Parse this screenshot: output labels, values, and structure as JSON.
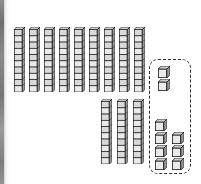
{
  "image": {
    "title": "Base-ten blocks place value model",
    "width": 201,
    "height": 184,
    "background_color": "#ffffff"
  },
  "legend": {
    "rod_name": "ten-rod",
    "cube_name": "unit-cube",
    "group_name": "dashed-grouping-box"
  },
  "colors": {
    "block_face": "#d9d9d9",
    "block_face_light": "#eaeaea",
    "block_top": "#cfcfcf",
    "block_side": "#9a9a9a",
    "outline": "#1a1a1a",
    "dash_stroke": "#2b2b2b",
    "background": "#ffffff",
    "scan_edge": "#7d7d7d"
  },
  "counts": {
    "rods_total": 12,
    "rods_top_row": 9,
    "rods_bottom_row": 3,
    "units_per_rod": 10,
    "cubes_total": 9,
    "cubes_top_cluster": 2,
    "cubes_bottom_cluster": 7,
    "value_from_rods": 120,
    "value_from_cubes": 9,
    "total_value": 129
  },
  "rods_top_row": [
    {
      "label": "ten-rod-1",
      "x": 14,
      "y": 27
    },
    {
      "label": "ten-rod-2",
      "x": 29,
      "y": 27
    },
    {
      "label": "ten-rod-3",
      "x": 44,
      "y": 27
    },
    {
      "label": "ten-rod-4",
      "x": 59,
      "y": 27
    },
    {
      "label": "ten-rod-5",
      "x": 74,
      "y": 27
    },
    {
      "label": "ten-rod-6",
      "x": 89,
      "y": 27
    },
    {
      "label": "ten-rod-7",
      "x": 104,
      "y": 27
    },
    {
      "label": "ten-rod-8",
      "x": 119,
      "y": 27
    },
    {
      "label": "ten-rod-9",
      "x": 134,
      "y": 27
    }
  ],
  "rods_bottom_row": [
    {
      "label": "ten-rod-10",
      "x": 101,
      "y": 99
    },
    {
      "label": "ten-rod-11",
      "x": 117,
      "y": 99
    },
    {
      "label": "ten-rod-12",
      "x": 133,
      "y": 99
    }
  ],
  "rod_size": {
    "width": 11,
    "height": 65
  },
  "cube_size": {
    "width": 12,
    "height": 12
  },
  "cubes_top_cluster": [
    {
      "label": "unit-cube-1",
      "x": 158,
      "y": 66
    },
    {
      "label": "unit-cube-2",
      "x": 158,
      "y": 79
    }
  ],
  "cubes_bottom_cluster": [
    {
      "label": "unit-cube-3",
      "x": 155,
      "y": 119
    },
    {
      "label": "unit-cube-4",
      "x": 155,
      "y": 132
    },
    {
      "label": "unit-cube-5",
      "x": 172,
      "y": 132
    },
    {
      "label": "unit-cube-6",
      "x": 155,
      "y": 145
    },
    {
      "label": "unit-cube-7",
      "x": 172,
      "y": 145
    },
    {
      "label": "unit-cube-8",
      "x": 155,
      "y": 158
    },
    {
      "label": "unit-cube-9",
      "x": 172,
      "y": 158
    }
  ],
  "dashed_box": {
    "label": "dashed-grouping-box",
    "x": 149,
    "y": 59,
    "width": 42,
    "height": 115
  }
}
